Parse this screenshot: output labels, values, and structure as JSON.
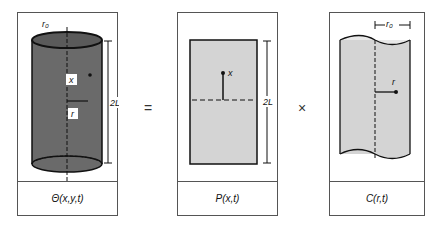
{
  "panels": [
    {
      "id": "theta",
      "caption": "Θ(x,y,t)",
      "labels": {
        "radius": "r₀",
        "axial": "x",
        "radial": "r",
        "length": "2L"
      }
    },
    {
      "id": "slab",
      "caption": "P(x,t)",
      "labels": {
        "axial": "x",
        "length": "2L"
      }
    },
    {
      "id": "cylinder",
      "caption": "C(r,t)",
      "labels": {
        "radius": "r₀",
        "radial": "r"
      }
    }
  ],
  "operators": {
    "equals": "=",
    "times": "×"
  },
  "colors": {
    "dark_fill": "#6a6a6a",
    "light_fill": "#d4d4d4",
    "line": "#111111"
  }
}
